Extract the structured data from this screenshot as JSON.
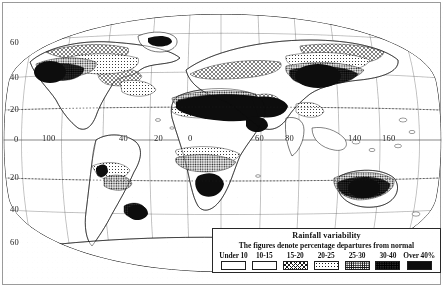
{
  "map": {
    "title": "Rainfall variability",
    "projection": "oval world projection",
    "axes": {
      "latitude_labels": [
        {
          "text": "60",
          "side": "left",
          "y": 43
        },
        {
          "text": "40",
          "side": "left",
          "y": 78
        },
        {
          "text": "20",
          "side": "left",
          "y": 110
        },
        {
          "text": "0",
          "side": "left",
          "y": 140
        },
        {
          "text": "20",
          "side": "left",
          "y": 178
        },
        {
          "text": "40",
          "side": "left",
          "y": 210
        },
        {
          "text": "60",
          "side": "left",
          "y": 243
        }
      ],
      "longitude_labels": [
        {
          "text": "100",
          "x": 47
        },
        {
          "text": "40",
          "x": 122
        },
        {
          "text": "20",
          "x": 157
        },
        {
          "text": "0",
          "x": 190
        },
        {
          "text": "60",
          "x": 258
        },
        {
          "text": "80",
          "x": 288
        },
        {
          "text": "140",
          "x": 352
        },
        {
          "text": "160",
          "x": 386
        }
      ]
    }
  },
  "legend": {
    "title": "Rainfall variability",
    "subtitle": "The figures denote percentage departures from normal",
    "classes": [
      {
        "label": "Under 10",
        "pattern": "blank",
        "swatch_class": "sw-blank"
      },
      {
        "label": "10-15",
        "pattern": "blank",
        "swatch_class": "sw-blank2"
      },
      {
        "label": "15-20",
        "pattern": "hatch",
        "swatch_class": "sw-hatch"
      },
      {
        "label": "20-25",
        "pattern": "fine-dot",
        "swatch_class": "sw-fine-dot"
      },
      {
        "label": "25-30",
        "pattern": "stipple",
        "swatch_class": "sw-stipple"
      },
      {
        "label": "30-40",
        "pattern": "dark",
        "swatch_class": "sw-dark"
      },
      {
        "label": "Over 40%",
        "pattern": "black",
        "swatch_class": "sw-black"
      }
    ]
  },
  "colors": {
    "ink": "#1a1a1a",
    "paper": "#fdfdfc",
    "frame": "#9a9a96",
    "black_fill": "#111111",
    "stipple_fill": "#f2f2f2"
  }
}
